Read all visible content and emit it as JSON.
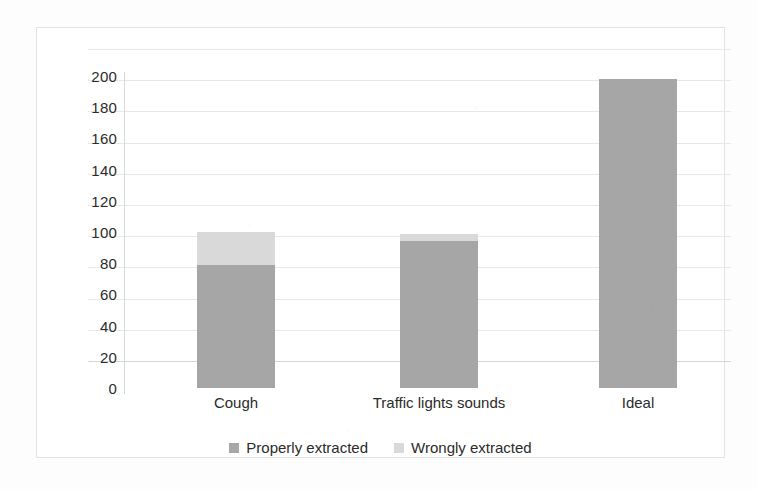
{
  "chart_data": {
    "type": "bar",
    "stacked": true,
    "title": "",
    "xlabel": "",
    "ylabel": "",
    "ylim": [
      0,
      200
    ],
    "yticks": [
      200,
      180,
      160,
      140,
      120,
      100,
      80,
      60,
      40,
      20,
      0
    ],
    "grid": true,
    "legend_position": "bottom",
    "categories": [
      "Cough",
      "Traffic lights sounds",
      "Ideal"
    ],
    "series": [
      {
        "name": "Properly extracted",
        "color": "#a6a6a6",
        "values": [
          79,
          94,
          198
        ]
      },
      {
        "name": "Wrongly extracted",
        "color": "#d9d9d9",
        "values": [
          21,
          5,
          0
        ]
      }
    ],
    "totals": [
      100,
      99,
      198
    ]
  },
  "axis": {
    "y_ticks": [
      "200",
      "180",
      "160",
      "140",
      "120",
      "100",
      "80",
      "60",
      "40",
      "20",
      "0"
    ],
    "x_ticks": [
      "Cough",
      "Traffic lights sounds",
      "Ideal"
    ]
  },
  "legend": {
    "items": [
      {
        "label": "Properly extracted",
        "color": "#a6a6a6"
      },
      {
        "label": "Wrongly extracted",
        "color": "#d9d9d9"
      }
    ]
  },
  "colors": {
    "properly_extracted": "#a6a6a6",
    "wrongly_extracted": "#d9d9d9",
    "gridline": "#e8e8e8",
    "frame": "#e3e3e3",
    "text": "#2b2b2b"
  }
}
